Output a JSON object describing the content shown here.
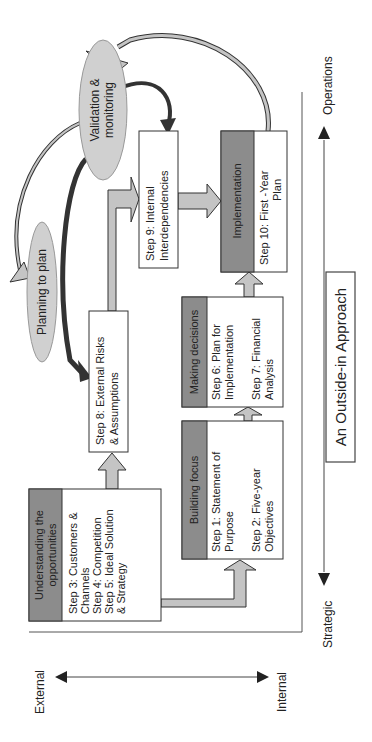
{
  "title": "An Outside-in Approach",
  "axes": {
    "vertical": {
      "top_label": "Operations",
      "bottom_label": "Strategic"
    },
    "horizontal": {
      "left_label": "External",
      "right_label": "Internal"
    }
  },
  "ellipses": {
    "validation": {
      "line1": "Validation &",
      "line2": "monitoring"
    },
    "planning": {
      "label": "Planning to plan"
    }
  },
  "groups": {
    "understanding": {
      "header_line1": "Understanding the",
      "header_line2": "opportunities",
      "lines": [
        "Step 3:  Customers &",
        "Channels",
        "Step 4:  Competition",
        "Step 5:  Ideal Solution",
        "& Strategy"
      ]
    },
    "building": {
      "header": "Building focus",
      "lines": [
        "Step 1:  Statement of",
        "Purpose",
        "Step 2:  Five-year",
        "Objectives"
      ]
    },
    "making": {
      "header": "Making decisions",
      "lines": [
        "Step 6:  Plan for",
        "Implementation",
        "Step 7:  Financial",
        "Analysis"
      ]
    },
    "implementation": {
      "header": "Implementation",
      "lines": [
        "Step 10:  First -Year",
        "Plan"
      ]
    }
  },
  "steps": {
    "step8": {
      "line1": "Step 8:  External Risks",
      "line2": "& Assumptions"
    },
    "step9": {
      "line1": "Step 9:  Internal",
      "line2": "Interdependencies"
    }
  },
  "colors": {
    "header_fill": "#8c8c8c",
    "ellipse_fill": "#d0d0d0",
    "arrow_fill": "#c4c4c4",
    "dark_arrow": "#333333",
    "line": "#333333"
  }
}
